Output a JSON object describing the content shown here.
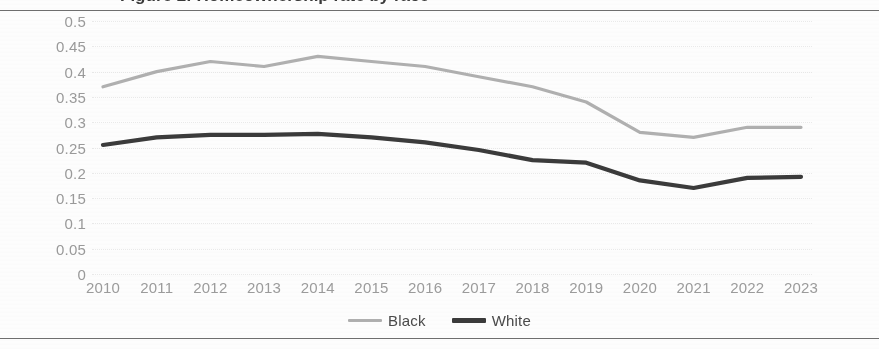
{
  "document": {
    "title_clipped": "Figure 2: Homeownership rate by race"
  },
  "legend": {
    "position": "bottom-center",
    "items": [
      {
        "label": "Black",
        "color": "#b0b0b0"
      },
      {
        "label": "White",
        "color": "#3b3b3b"
      }
    ]
  },
  "chart_data": {
    "type": "line",
    "title": "",
    "xlabel": "",
    "ylabel": "",
    "x": [
      2010,
      2011,
      2012,
      2013,
      2014,
      2015,
      2016,
      2017,
      2018,
      2019,
      2020,
      2021,
      2022,
      2023
    ],
    "categories": [
      "2010",
      "2011",
      "2012",
      "2013",
      "2014",
      "2015",
      "2016",
      "2017",
      "2018",
      "2019",
      "2020",
      "2021",
      "2022",
      "2023"
    ],
    "series": [
      {
        "name": "Black",
        "color": "#b0b0b0",
        "values": [
          0.37,
          0.4,
          0.42,
          0.41,
          0.43,
          0.42,
          0.41,
          0.39,
          0.37,
          0.34,
          0.28,
          0.27,
          0.29,
          0.29
        ]
      },
      {
        "name": "White",
        "color": "#3b3b3b",
        "values": [
          0.255,
          0.27,
          0.275,
          0.275,
          0.277,
          0.27,
          0.26,
          0.245,
          0.225,
          0.22,
          0.185,
          0.17,
          0.19,
          0.192
        ]
      }
    ],
    "ylim": [
      0,
      0.5
    ],
    "ytick_step": 0.05,
    "yticks": [
      "0.5",
      "0.45",
      "0.4",
      "0.35",
      "0.3",
      "0.25",
      "0.2",
      "0.15",
      "0.1",
      "0.05",
      "0"
    ],
    "ytick_values": [
      0.5,
      0.45,
      0.4,
      0.35,
      0.3,
      0.25,
      0.2,
      0.15,
      0.1,
      0.05,
      0
    ],
    "grid": true,
    "legend_position": "bottom"
  }
}
